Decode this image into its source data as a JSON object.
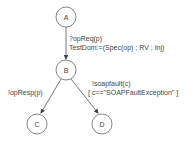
{
  "diagram": {
    "type": "state-machine",
    "nodes": [
      {
        "id": "A",
        "label": "A"
      },
      {
        "id": "B",
        "label": "B"
      },
      {
        "id": "C",
        "label": "C"
      },
      {
        "id": "D",
        "label": "D"
      }
    ],
    "edges": [
      {
        "from": "A",
        "to": "B",
        "label_line1": "?opReq(p)",
        "label_line2": "TestDom:=(Spec(op) ; RV ; Inj)"
      },
      {
        "from": "B",
        "to": "C",
        "label_line1": "!opResp(p)"
      },
      {
        "from": "B",
        "to": "D",
        "label_line1": "!soapfault(c)",
        "label_line2": "[ c==\"SOAPFaultException\" ]"
      }
    ],
    "colors": {
      "stroke": "#555555",
      "text": "#444444"
    }
  }
}
